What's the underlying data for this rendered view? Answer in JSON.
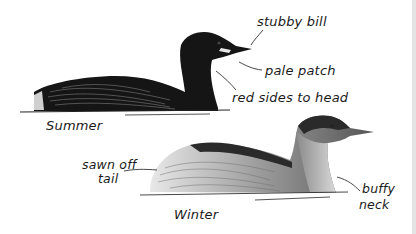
{
  "figure": {
    "birds": [
      {
        "id": "summer",
        "caption": "Summer",
        "annotations": [
          {
            "id": "stubby-bill",
            "text": "stubby bill"
          },
          {
            "id": "pale-patch",
            "text": "pale patch"
          },
          {
            "id": "red-sides-to-head",
            "text": "red sides to head"
          }
        ]
      },
      {
        "id": "winter",
        "caption": "Winter",
        "annotations": [
          {
            "id": "sawn-off-tail",
            "text_line1": "sawn off",
            "text_line2": "tail"
          },
          {
            "id": "buffy-neck",
            "text_line1": "buffy",
            "text_line2": "neck"
          }
        ]
      }
    ]
  }
}
